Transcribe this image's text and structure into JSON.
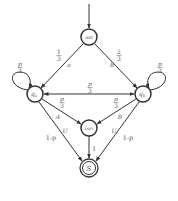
{
  "diagram": {
    "type": "state-machine",
    "states": [
      {
        "id": "init",
        "label": "init",
        "initial": true
      },
      {
        "id": "qa",
        "label": "q",
        "sub": "a"
      },
      {
        "id": "qb",
        "label": "q",
        "sub": "b"
      },
      {
        "id": "corr",
        "label": "corr"
      },
      {
        "id": "S",
        "label": "S",
        "accepting": true
      }
    ],
    "transitions": {
      "init_qa": {
        "prob_num": "1",
        "prob_den": "3",
        "symbol": "a"
      },
      "init_qb": {
        "prob_num": "2",
        "prob_den": "3",
        "symbol": "b"
      },
      "qa_loop": {
        "prob_num": "p",
        "prob_den": "3"
      },
      "qb_loop": {
        "prob_num": "p",
        "prob_den": "3"
      },
      "qa_qb": {
        "prob_num": "p",
        "prob_den": "3"
      },
      "qa_corr": {
        "prob_num": "p",
        "prob_den": "3",
        "symbol": "A"
      },
      "qb_corr": {
        "prob_num": "p",
        "prob_den": "3",
        "symbol": "B"
      },
      "qa_S": {
        "prob": "1-p",
        "symbol": "U"
      },
      "qb_S": {
        "prob": "1-p",
        "symbol": "U"
      },
      "corr_S": {
        "prob": "1"
      }
    }
  }
}
